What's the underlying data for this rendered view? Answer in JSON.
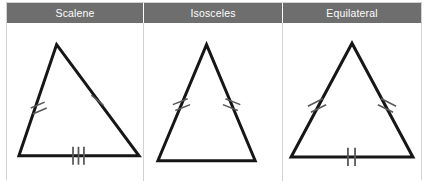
{
  "diagram": {
    "stroke_color": "#161616",
    "tick_color": "#5a5a5a",
    "header_background": "#6e6e6e",
    "header_text_color": "#ffffff",
    "border_color": "#d2d2d2",
    "page_background": "#ffffff"
  },
  "columns": [
    {
      "id": "scalene",
      "label": "Scalene",
      "description": "Triangle with three sides of different lengths; each side carries a different number of congruence ticks.",
      "triangle": {
        "apex": [
          50,
          20
        ],
        "bottom_left": [
          12,
          132
        ],
        "bottom_right": [
          133,
          132
        ],
        "sides": [
          {
            "name": "left-side",
            "ticks": 2
          },
          {
            "name": "right-side",
            "ticks": 1
          },
          {
            "name": "base",
            "ticks": 3
          }
        ]
      }
    },
    {
      "id": "isosceles",
      "label": "Isosceles",
      "description": "Triangle with two equal sides; the two legs carry two congruence ticks each and the base is unmarked.",
      "triangle": {
        "apex": [
          63,
          20
        ],
        "bottom_left": [
          14,
          137
        ],
        "bottom_right": [
          112,
          137
        ],
        "sides": [
          {
            "name": "left-side",
            "ticks": 2
          },
          {
            "name": "right-side",
            "ticks": 2
          },
          {
            "name": "base",
            "ticks": 0
          }
        ]
      }
    },
    {
      "id": "equilateral",
      "label": "Equilateral",
      "description": "Triangle with three equal sides; all three sides carry two congruence ticks.",
      "triangle": {
        "apex": [
          68,
          20
        ],
        "bottom_left": [
          8,
          132
        ],
        "bottom_right": [
          128,
          132
        ],
        "sides": [
          {
            "name": "left-side",
            "ticks": 2
          },
          {
            "name": "right-side",
            "ticks": 2
          },
          {
            "name": "base",
            "ticks": 2
          }
        ]
      }
    }
  ]
}
